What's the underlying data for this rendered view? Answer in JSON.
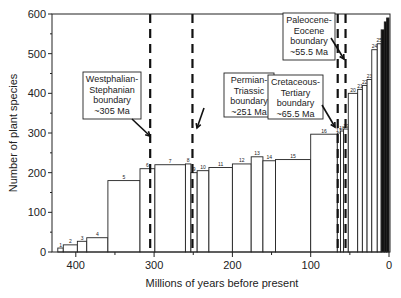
{
  "chart_data": {
    "type": "bar",
    "title": "",
    "xlabel": "Millions of years before present",
    "ylabel": "Number of plant species",
    "xlim": [
      425,
      0
    ],
    "ylim": [
      0,
      600
    ],
    "x_inverted": true,
    "grid": false,
    "legend": null,
    "x_ticks": [
      400,
      300,
      200,
      100,
      0
    ],
    "y_ticks": [
      0,
      100,
      200,
      300,
      400,
      500,
      600
    ],
    "bars": [
      {
        "label": "1",
        "start_ma": 423,
        "end_ma": 416,
        "value": 10
      },
      {
        "label": "2",
        "start_ma": 416,
        "end_ma": 398,
        "value": 18
      },
      {
        "label": "3",
        "start_ma": 398,
        "end_ma": 386,
        "value": 27
      },
      {
        "label": "4",
        "start_ma": 386,
        "end_ma": 359,
        "value": 36
      },
      {
        "label": "5",
        "start_ma": 359,
        "end_ma": 318,
        "value": 180
      },
      {
        "label": "6",
        "start_ma": 318,
        "end_ma": 299,
        "value": 210
      },
      {
        "label": "7",
        "start_ma": 299,
        "end_ma": 260,
        "value": 220
      },
      {
        "label": "8",
        "start_ma": 260,
        "end_ma": 253,
        "value": 222
      },
      {
        "label": "9",
        "start_ma": 253,
        "end_ma": 245,
        "value": 200
      },
      {
        "label": "10",
        "start_ma": 245,
        "end_ma": 230,
        "value": 205
      },
      {
        "label": "11",
        "start_ma": 230,
        "end_ma": 200,
        "value": 213
      },
      {
        "label": "12",
        "start_ma": 200,
        "end_ma": 176,
        "value": 222
      },
      {
        "label": "13",
        "start_ma": 176,
        "end_ma": 161,
        "value": 240
      },
      {
        "label": "14",
        "start_ma": 161,
        "end_ma": 145,
        "value": 230
      },
      {
        "label": "15",
        "start_ma": 145,
        "end_ma": 100,
        "value": 233
      },
      {
        "label": "16",
        "start_ma": 100,
        "end_ma": 66,
        "value": 297
      },
      {
        "label": "17",
        "start_ma": 66,
        "end_ma": 62,
        "value": 300
      },
      {
        "label": "18",
        "start_ma": 62,
        "end_ma": 58,
        "value": 305
      },
      {
        "label": "19",
        "start_ma": 58,
        "end_ma": 52,
        "value": 310
      },
      {
        "label": "20",
        "start_ma": 52,
        "end_ma": 40,
        "value": 400
      },
      {
        "label": "21",
        "start_ma": 40,
        "end_ma": 34,
        "value": 410
      },
      {
        "label": "22",
        "start_ma": 34,
        "end_ma": 28,
        "value": 420
      },
      {
        "label": "23",
        "start_ma": 28,
        "end_ma": 22,
        "value": 435
      },
      {
        "label": "24",
        "start_ma": 22,
        "end_ma": 15,
        "value": 510
      },
      {
        "label": "25",
        "start_ma": 15,
        "end_ma": 10,
        "value": 525
      },
      {
        "label": "26",
        "start_ma": 10,
        "end_ma": 6,
        "value": 560
      },
      {
        "label": "27",
        "start_ma": 6,
        "end_ma": 3,
        "value": 580
      },
      {
        "label": "28",
        "start_ma": 3,
        "end_ma": 0,
        "value": 590
      }
    ],
    "categories": [
      "1",
      "2",
      "3",
      "4",
      "5",
      "6",
      "7",
      "8",
      "9",
      "10",
      "11",
      "12",
      "13",
      "14",
      "15",
      "16",
      "17",
      "18",
      "19",
      "20",
      "21",
      "22",
      "23",
      "24",
      "25",
      "26",
      "27",
      "28"
    ],
    "values": [
      10,
      18,
      27,
      36,
      180,
      210,
      220,
      222,
      200,
      205,
      213,
      222,
      240,
      230,
      233,
      297,
      300,
      305,
      310,
      400,
      410,
      420,
      435,
      510,
      525,
      560,
      580,
      590
    ],
    "boundaries": [
      {
        "name": "Westphalian-Stephanian boundary",
        "ma": 305
      },
      {
        "name": "Permian-Triassic boundary",
        "ma": 251
      },
      {
        "name": "Cretaceous-Tertiary boundary",
        "ma": 65.5
      },
      {
        "name": "Paleocene-Eocene boundary",
        "ma": 55.5
      }
    ],
    "annotations": [
      {
        "lines": [
          "Westphalian-",
          "Stephanian",
          "boundary",
          "~305 Ma"
        ],
        "target_ma": 305
      },
      {
        "lines": [
          "Permian-",
          "Triassic",
          "boundary",
          "~251 Ma"
        ],
        "target_ma": 251
      },
      {
        "lines": [
          "Cretaceous-",
          "Tertiary",
          "boundary",
          "~65.5 Ma"
        ],
        "target_ma": 65.5
      },
      {
        "lines": [
          "Paleocene-",
          "Eocene",
          "boundary",
          "~55.5 Ma"
        ],
        "target_ma": 55.5
      }
    ]
  }
}
